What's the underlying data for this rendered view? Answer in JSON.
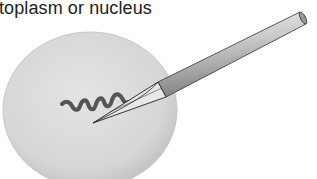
{
  "diagram": {
    "caption": "toplasm or nucleus",
    "elements": {
      "cell": "cell-body",
      "dna": "dna-strand",
      "needle": "injection-needle"
    },
    "colors": {
      "cell_fill": "#d9d9d9",
      "cell_edge": "#bdbdbd",
      "dna": "#555555",
      "needle_light": "#e6e6e6",
      "needle_dark": "#8a8a8a",
      "outline": "#222222"
    }
  }
}
